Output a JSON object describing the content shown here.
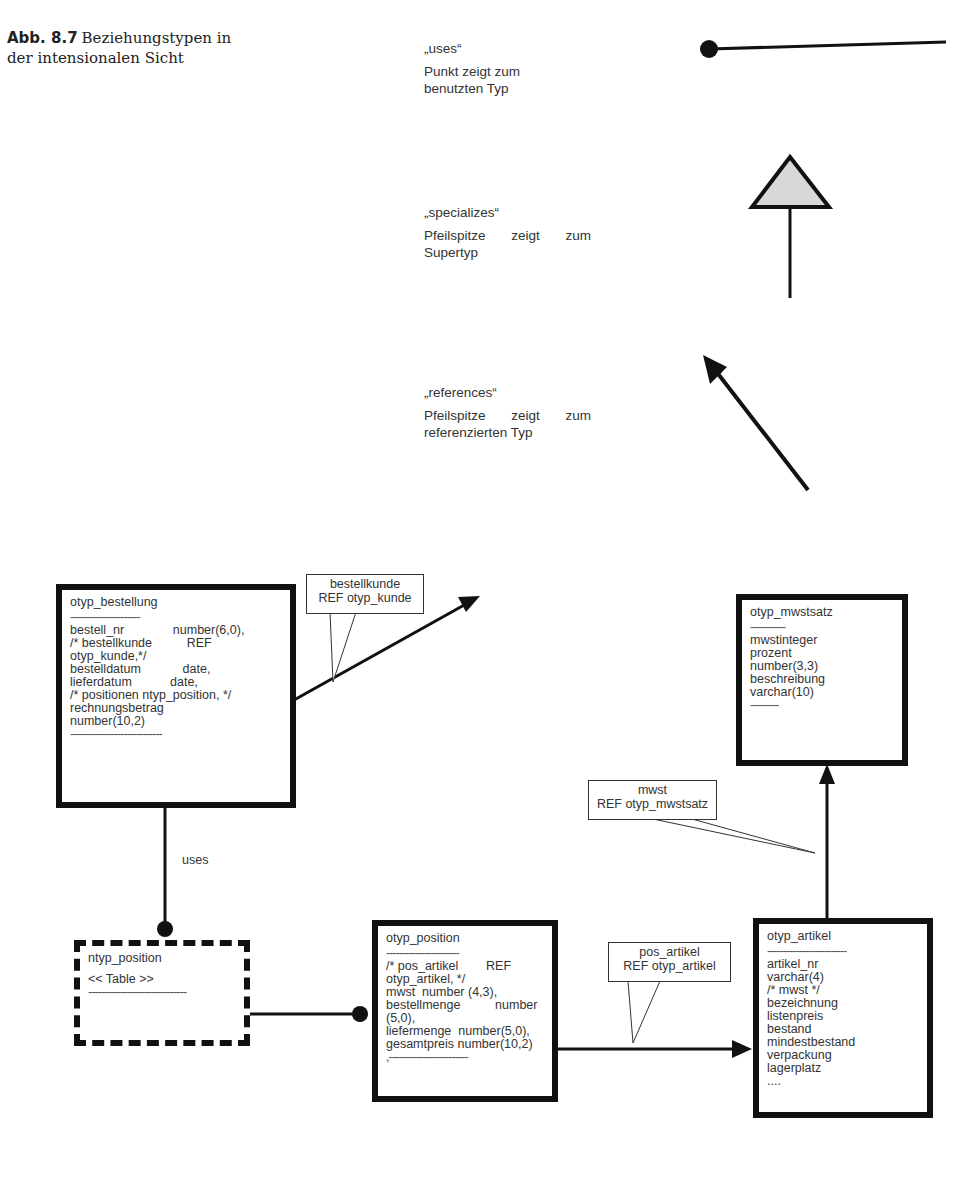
{
  "caption": {
    "label": "Abb. 8.7",
    "line1": "Beziehungstypen in",
    "line2": "der intensionalen Sicht"
  },
  "legend": [
    {
      "name": "„uses“",
      "desc1": "Punkt zeigt zum",
      "desc2": "benutzten Typ",
      "symbol": "dot-line"
    },
    {
      "name": "„specializes“",
      "desc1": "Pfeilspitze zeigt zum",
      "desc2": "Supertyp",
      "symbol": "hollow-triangle-arrow"
    },
    {
      "name": "„references“",
      "desc1": "Pfeilspitze zeigt zum",
      "desc2": "referenzierten Typ",
      "symbol": "filled-arrow"
    }
  ],
  "types": {
    "bestellung": {
      "title": "otyp_bestellung",
      "sep_top": "----------------------",
      "rows": [
        "bestell_nr              number(6,0),",
        "/* bestellkunde          REF",
        "otyp_kunde,*/",
        "bestelldatum            date,",
        "lieferdatum           date,",
        "/* positionen ntyp_position, */",
        "rechnungsbetrag",
        "number(10,2)"
      ],
      "sep_bottom": "-----------------------------"
    },
    "ntyp_position": {
      "title": "ntyp_position",
      "stereotype": "<< Table >>",
      "sep": "-------------------------------"
    },
    "position": {
      "title": "otyp_position",
      "sep_top": "-----------------------",
      "rows": [
        "/* pos_artikel        REF",
        "otyp_artikel, */",
        "mwst  number (4,3),",
        "bestellmenge          number",
        "(5,0),",
        "liefermenge  number(5,0),",
        "gesamtpreis number(10,2)"
      ],
      "sep_bottom": ",-------------------------"
    },
    "artikel": {
      "title": "otyp_artikel",
      "sep_top": "-------------------------",
      "rows": [
        "artikel_nr",
        "varchar(4)",
        "/* mwst */",
        "bezeichnung",
        "listenpreis",
        "bestand",
        "mindestbestand",
        "verpackung",
        "lagerplatz",
        "...."
      ]
    },
    "mwstsatz": {
      "title": "otyp_mwstsatz",
      "sep_top": "-----------",
      "rows": [
        "mwstinteger",
        "prozent",
        "number(3,3)",
        "beschreibung",
        "varchar(10)"
      ],
      "sep_bottom": "---------"
    }
  },
  "callouts": {
    "bestellkunde": {
      "line1": "bestellkunde",
      "line2": "REF otyp_kunde"
    },
    "mwst": {
      "line1": "mwst",
      "line2": "REF otyp_mwstsatz"
    },
    "pos_artikel": {
      "line1": "pos_artikel",
      "line2": "REF otyp_artikel"
    }
  },
  "edges": {
    "uses_label": "uses"
  }
}
